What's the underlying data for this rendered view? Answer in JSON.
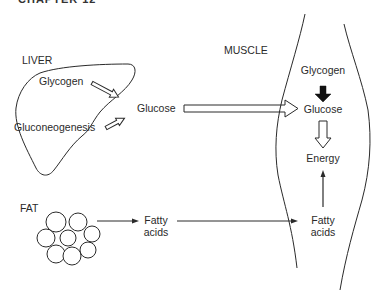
{
  "figure": {
    "cut_title": "CHAPTER 12"
  },
  "liver": {
    "label": "LIVER",
    "glycogen": "Glycogen",
    "gluconeogenesis": "Gluconeogenesis",
    "glucose": "Glucose"
  },
  "muscle": {
    "label": "MUSCLE",
    "glycogen": "Glycogen",
    "glucose": "Glucose",
    "energy": "Energy",
    "fatty_acids_line1": "Fatty",
    "fatty_acids_line2": "acids"
  },
  "fat": {
    "label": "FAT",
    "fatty_acids_line1": "Fatty",
    "fatty_acids_line2": "acids"
  },
  "colors": {
    "line": "#2a2a2a",
    "background": "#ffffff"
  }
}
